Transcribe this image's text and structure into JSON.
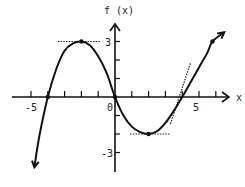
{
  "chart_data": {
    "type": "line",
    "title": "",
    "xlabel": "x",
    "ylabel": "f (x)",
    "xlim": [
      -6.5,
      7
    ],
    "ylim": [
      -4,
      4
    ],
    "x_tick_labels": [
      {
        "value": -5,
        "label": "-5"
      },
      {
        "value": 0,
        "label": "0"
      },
      {
        "value": 5,
        "label": "5"
      }
    ],
    "y_tick_labels": [
      {
        "value": 3,
        "label": "3"
      },
      {
        "value": -3,
        "label": "-3"
      }
    ],
    "x_ticks": [
      -5,
      -4,
      -3,
      -2,
      -1,
      1,
      2,
      3,
      4,
      5,
      6
    ],
    "y_ticks": [
      -3,
      -2,
      -1,
      1,
      2,
      3
    ],
    "grid": false,
    "legend": null,
    "series": [
      {
        "name": "f(x)",
        "x": [
          -4.8,
          -4.5,
          -4.0,
          -3.5,
          -3.0,
          -2.5,
          -2.0,
          -1.5,
          -1.0,
          -0.5,
          0.0,
          0.5,
          1.0,
          1.5,
          2.0,
          2.5,
          3.0,
          3.5,
          4.0,
          4.5,
          5.0,
          5.5,
          5.8,
          6.5
        ],
        "y": [
          -3.8,
          -2.1,
          0.0,
          1.5,
          2.5,
          2.9,
          3.0,
          2.8,
          2.2,
          1.3,
          0.0,
          -1.0,
          -1.6,
          -1.9,
          -2.0,
          -1.85,
          -1.4,
          -0.75,
          0.0,
          0.8,
          1.6,
          2.4,
          3.0,
          3.5
        ]
      }
    ],
    "marked_points": [
      {
        "x": -4,
        "y": 0
      },
      {
        "x": -2,
        "y": 3
      },
      {
        "x": 0,
        "y": 0
      },
      {
        "x": 2,
        "y": -2
      },
      {
        "x": 5.8,
        "y": 3
      }
    ],
    "tangent_lines": [
      {
        "x1": -3.4,
        "y1": 3,
        "x2": -0.9,
        "y2": 3
      },
      {
        "x1": 0.9,
        "y1": -2,
        "x2": 3.3,
        "y2": -2
      },
      {
        "x1": 3.3,
        "y1": -1.45,
        "x2": 4.5,
        "y2": 1.85
      }
    ],
    "annotations": []
  }
}
